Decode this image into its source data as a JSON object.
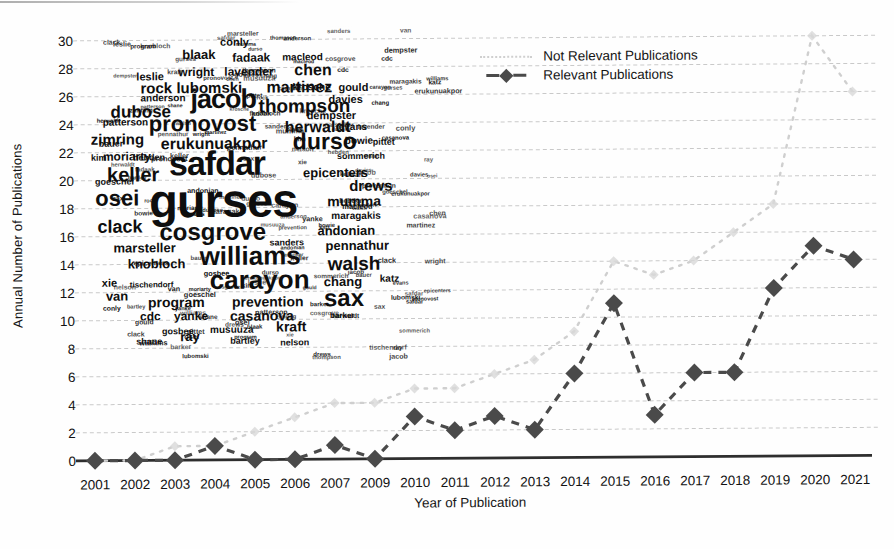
{
  "chart_data": {
    "type": "line",
    "title": "",
    "categories": [
      "2001",
      "2002",
      "2003",
      "2004",
      "2005",
      "2006",
      "2007",
      "2009",
      "2010",
      "2011",
      "2012",
      "2013",
      "2014",
      "2015",
      "2016",
      "2017",
      "2018",
      "2019",
      "2020",
      "2021"
    ],
    "series": [
      {
        "name": "Not Relevant Publications",
        "style": "light-dotted",
        "color": "#cfcfcf",
        "marker_color": "#d8d8d8",
        "values": [
          0,
          0,
          1,
          1,
          2,
          3,
          4,
          4,
          5,
          5,
          6,
          7,
          9,
          14,
          13,
          14,
          16,
          18,
          30,
          26
        ]
      },
      {
        "name": "Relevant Publications",
        "style": "dark-dashed",
        "color": "#4a4a4a",
        "marker": "diamond",
        "values": [
          0,
          0,
          0,
          1,
          0,
          0,
          1,
          0,
          3,
          2,
          3,
          2,
          6,
          11,
          3,
          6,
          6,
          12,
          15,
          14
        ]
      }
    ],
    "xlabel": "Year of Publication",
    "ylabel": "Annual Number of Publications",
    "ylim": [
      0,
      30
    ],
    "ytick_step": 2,
    "grid": "horizontal-dashed",
    "grid_color": "#c9c9c9",
    "axis_color": "#2e2e2e",
    "tick_label_color": "#121212",
    "legend_position": "top-right"
  },
  "wordcloud": {
    "words": [
      {
        "t": "gurses",
        "x": 58,
        "y": 152,
        "s": 47
      },
      {
        "t": "safdar",
        "x": 78,
        "y": 120,
        "s": 34
      },
      {
        "t": "jacob",
        "x": 100,
        "y": 60,
        "s": 27
      },
      {
        "t": "cosgrove",
        "x": 68,
        "y": 194,
        "s": 24
      },
      {
        "t": "williams",
        "x": 108,
        "y": 217,
        "s": 26
      },
      {
        "t": "carayon",
        "x": 118,
        "y": 241,
        "s": 26
      },
      {
        "t": "pronovost",
        "x": 58,
        "y": 87,
        "s": 22
      },
      {
        "t": "durso",
        "x": 202,
        "y": 105,
        "s": 23
      },
      {
        "t": "sax",
        "x": 232,
        "y": 261,
        "s": 24
      },
      {
        "t": "keller",
        "x": 16,
        "y": 138,
        "s": 20
      },
      {
        "t": "osei",
        "x": 4,
        "y": 161,
        "s": 22
      },
      {
        "t": "thompson",
        "x": 168,
        "y": 71,
        "s": 19
      },
      {
        "t": "walsh",
        "x": 236,
        "y": 229,
        "s": 19
      },
      {
        "t": "herwaldt",
        "x": 194,
        "y": 93,
        "s": 16
      },
      {
        "t": "erukunuakpor",
        "x": 70,
        "y": 109,
        "s": 16
      },
      {
        "t": "martinez",
        "x": 176,
        "y": 53,
        "s": 16
      },
      {
        "t": "clack",
        "x": 6,
        "y": 191,
        "s": 18
      },
      {
        "t": "dubose",
        "x": 20,
        "y": 77,
        "s": 17
      },
      {
        "t": "zimring",
        "x": 0,
        "y": 105,
        "s": 15
      },
      {
        "t": "rock",
        "x": 50,
        "y": 54,
        "s": 15
      },
      {
        "t": "lubomski",
        "x": 86,
        "y": 54,
        "s": 15
      },
      {
        "t": "chen",
        "x": 204,
        "y": 36,
        "s": 16
      },
      {
        "t": "drews",
        "x": 258,
        "y": 153,
        "s": 15
      },
      {
        "t": "mumma",
        "x": 236,
        "y": 169,
        "s": 14
      },
      {
        "t": "epicenters",
        "x": 212,
        "y": 141,
        "s": 13
      },
      {
        "t": "andonian",
        "x": 226,
        "y": 199,
        "s": 13
      },
      {
        "t": "pennathur",
        "x": 234,
        "y": 214,
        "s": 13
      },
      {
        "t": "marsteller",
        "x": 22,
        "y": 215,
        "s": 13
      },
      {
        "t": "knobloch",
        "x": 36,
        "y": 231,
        "s": 13
      },
      {
        "t": "prevention",
        "x": 140,
        "y": 269,
        "s": 14
      },
      {
        "t": "program",
        "x": 56,
        "y": 269,
        "s": 14
      },
      {
        "t": "casanova",
        "x": 138,
        "y": 283,
        "s": 14
      },
      {
        "t": "moriarty",
        "x": 12,
        "y": 124,
        "s": 12
      },
      {
        "t": "wright",
        "x": 88,
        "y": 40,
        "s": 12
      },
      {
        "t": "lavender",
        "x": 134,
        "y": 40,
        "s": 12
      },
      {
        "t": "leslie",
        "x": 46,
        "y": 44,
        "s": 11
      },
      {
        "t": "blaak",
        "x": 92,
        "y": 22,
        "s": 13
      },
      {
        "t": "fadaak",
        "x": 142,
        "y": 26,
        "s": 12
      },
      {
        "t": "conly",
        "x": 130,
        "y": 10,
        "s": 11
      },
      {
        "t": "macleod",
        "x": 192,
        "y": 26,
        "s": 10
      },
      {
        "t": "gould",
        "x": 248,
        "y": 56,
        "s": 11
      },
      {
        "t": "krosche",
        "x": 202,
        "y": 56,
        "s": 10
      },
      {
        "t": "davies",
        "x": 238,
        "y": 68,
        "s": 11
      },
      {
        "t": "anderson",
        "x": 50,
        "y": 66,
        "s": 10
      },
      {
        "t": "dempster",
        "x": 216,
        "y": 84,
        "s": 11
      },
      {
        "t": "evans",
        "x": 248,
        "y": 96,
        "s": 10
      },
      {
        "t": "bowie",
        "x": 254,
        "y": 110,
        "s": 10
      },
      {
        "t": "pittet",
        "x": 282,
        "y": 112,
        "s": 9
      },
      {
        "t": "sommerich",
        "x": 246,
        "y": 126,
        "s": 9
      },
      {
        "t": "patterson",
        "x": 12,
        "y": 90,
        "s": 10
      },
      {
        "t": "kim",
        "x": 0,
        "y": 126,
        "s": 9
      },
      {
        "t": "bauer",
        "x": 8,
        "y": 112,
        "s": 9
      },
      {
        "t": "hebden",
        "x": 42,
        "y": 126,
        "s": 9
      },
      {
        "t": "goeschel",
        "x": 4,
        "y": 150,
        "s": 9
      },
      {
        "t": "maragakis",
        "x": 240,
        "y": 185,
        "s": 10
      },
      {
        "t": "sanders",
        "x": 178,
        "y": 212,
        "s": 9
      },
      {
        "t": "chang",
        "x": 232,
        "y": 250,
        "s": 13
      },
      {
        "t": "katz",
        "x": 288,
        "y": 248,
        "s": 10
      },
      {
        "t": "xie",
        "x": 10,
        "y": 250,
        "s": 11
      },
      {
        "t": "tischendorf",
        "x": 38,
        "y": 254,
        "s": 8
      },
      {
        "t": "van",
        "x": 14,
        "y": 263,
        "s": 13
      },
      {
        "t": "cdc",
        "x": 48,
        "y": 284,
        "s": 12
      },
      {
        "t": "yanke",
        "x": 82,
        "y": 284,
        "s": 12
      },
      {
        "t": "kraft",
        "x": 184,
        "y": 294,
        "s": 14
      },
      {
        "t": "musuuza",
        "x": 118,
        "y": 298,
        "s": 10
      },
      {
        "t": "gosbee",
        "x": 70,
        "y": 300,
        "s": 9
      },
      {
        "t": "shane",
        "x": 44,
        "y": 310,
        "s": 9
      },
      {
        "t": "ray",
        "x": 88,
        "y": 304,
        "s": 13
      },
      {
        "t": "bartley",
        "x": 138,
        "y": 310,
        "s": 9
      },
      {
        "t": "nelson",
        "x": 188,
        "y": 312,
        "s": 9
      },
      {
        "t": "barker",
        "x": 238,
        "y": 286,
        "s": 8
      }
    ],
    "filler_count": 160
  }
}
